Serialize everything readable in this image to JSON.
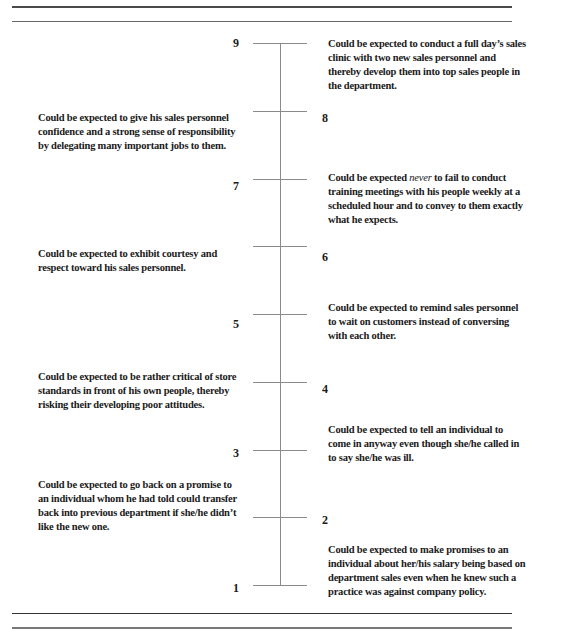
{
  "scale": {
    "min": 1,
    "max": 9,
    "anchors": [
      {
        "value": 9,
        "side": "right",
        "text": "Could be expected to conduct a full day’s sales clinic with two new sales personnel and thereby develop them into top sales people in the department."
      },
      {
        "value": 8,
        "side": "left",
        "text": "Could be expected to give his sales personnel confidence and a strong sense of responsibility by delegating many important jobs to them."
      },
      {
        "value": 7,
        "side": "right",
        "text_before": "Could be expected ",
        "text_emphasis": "never",
        "text_after": " to fail to conduct training meetings with his people weekly at a scheduled hour and to convey to them exactly what he expects."
      },
      {
        "value": 6,
        "side": "left",
        "text": "Could be expected to exhibit courtesy and respect toward his sales personnel."
      },
      {
        "value": 5,
        "side": "right",
        "text": "Could be expected to remind sales personnel to wait on customers instead of conversing with each other."
      },
      {
        "value": 4,
        "side": "left",
        "text": "Could be expected to be rather critical of store standards in front of his own people, thereby risking their developing poor attitudes."
      },
      {
        "value": 3,
        "side": "right",
        "text": "Could be expected to tell an individual to come in anyway even though she/he called in to say she/he was ill."
      },
      {
        "value": 2,
        "side": "left",
        "text": "Could be expected to go back on a promise to an individual whom he had told could transfer back into previous department if she/he didn’t like the new one."
      },
      {
        "value": 1,
        "side": "right",
        "text": "Could be expected to make promises to an individual about her/his salary being based on department sales even when he knew such a practice was against company policy."
      }
    ]
  },
  "labels": {
    "n9": "9",
    "n8": "8",
    "n7": "7",
    "n6": "6",
    "n5": "5",
    "n4": "4",
    "n3": "3",
    "n2": "2",
    "n1": "1"
  }
}
